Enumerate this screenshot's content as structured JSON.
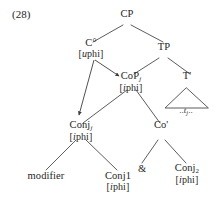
{
  "example": {
    "number": "(28)"
  },
  "tree": {
    "nodes": {
      "cp": {
        "label": "CP",
        "features": ""
      },
      "c_head": {
        "label": "C°",
        "features": "[uphi]"
      },
      "tp": {
        "label": "TP",
        "features": ""
      },
      "cop": {
        "label": "CoP",
        "subscript": "j",
        "features": "[iphi]"
      },
      "tbar": {
        "label": "T'",
        "features": ""
      },
      "conj_j": {
        "label": "Conj",
        "subscript": "j",
        "features": "[iphi]"
      },
      "cobar": {
        "label": "Co'",
        "features": ""
      },
      "modifier": {
        "label": "modifier",
        "features": ""
      },
      "conj1": {
        "label": "Conj1",
        "features": "[iphi]"
      },
      "coord": {
        "label": "&"
      },
      "conj2": {
        "label": "Conj",
        "subscript": "2",
        "features": "[iphi]"
      }
    },
    "trace": "..t_j..",
    "arrows": [
      {
        "from": "c_head",
        "to": "cop",
        "kind": "agree-arrow"
      },
      {
        "from": "c_head",
        "to": "conj_j",
        "kind": "agree-arrow"
      }
    ],
    "triangle_under": "tbar"
  },
  "colors": {
    "ink": "#262626",
    "line": "#4a4a4a",
    "background": "#ffffff"
  }
}
